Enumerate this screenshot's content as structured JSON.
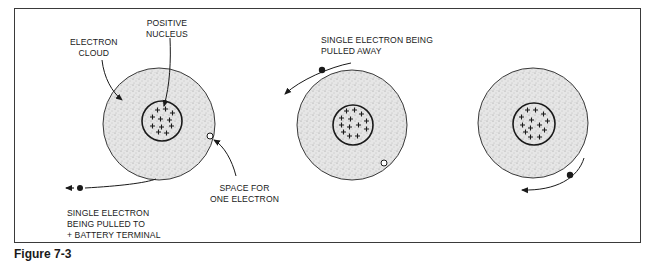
{
  "figure": {
    "labels": {
      "electron_cloud": "ELECTRON\nCLOUD",
      "positive_nucleus": "POSITIVE\nNUCLEUS",
      "space_for_one_electron": "SPACE FOR\nONE ELECTRON",
      "single_electron_pulled_to_terminal": "SINGLE ELECTRON\nBEING PULLED TO\n+ BATTERY TERMINAL",
      "single_electron_pulled_away": "SINGLE ELECTRON BEING\nPULLED AWAY"
    },
    "atoms": [
      {
        "name": "atom-1",
        "cx": 159,
        "cy": 124,
        "r_cloud": 56,
        "nucleus_cx": 162,
        "nucleus_cy": 121,
        "r_nucleus": 20
      },
      {
        "name": "atom-2",
        "cx": 352,
        "cy": 125,
        "r_cloud": 55,
        "nucleus_cx": 352,
        "nucleus_cy": 125,
        "r_nucleus": 20
      },
      {
        "name": "atom-3",
        "cx": 533,
        "cy": 123,
        "r_cloud": 55,
        "nucleus_cx": 534,
        "nucleus_cy": 124,
        "r_nucleus": 21
      }
    ],
    "colors": {
      "ink": "#1a1a1a",
      "stipple": "#d9d9d9",
      "background": "#ffffff"
    },
    "caption_fragment": "Figure 7-3"
  }
}
